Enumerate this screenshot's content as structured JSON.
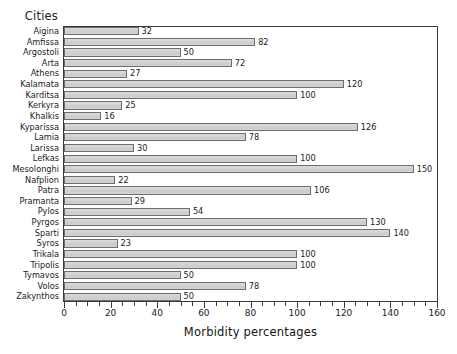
{
  "chart_data": {
    "type": "bar",
    "orientation": "horizontal",
    "title": "",
    "xlabel": "Morbidity percentages",
    "ylabel": "Cities",
    "xlim": [
      0,
      160
    ],
    "major_tick_step": 20,
    "minor_tick_step": 5,
    "grid": false,
    "legend": false,
    "bar_fill_color": "#d2d2d2",
    "bar_border_color": "#6d6d6d",
    "value_labels_shown": true,
    "categories": [
      "Aigina",
      "Amfissa",
      "Argostoli",
      "Arta",
      "Athens",
      "Kalamata",
      "Karditsa",
      "Kerkyra",
      "Khalkis",
      "Kyparissa",
      "Lamia",
      "Larissa",
      "Lefkas",
      "Mesolonghi",
      "Nafplion",
      "Patra",
      "Pramanta",
      "Pylos",
      "Pyrgos",
      "Sparti",
      "Syros",
      "Trikala",
      "Tripolis",
      "Tymavos",
      "Volos",
      "Zakynthos"
    ],
    "values": [
      32,
      82,
      50,
      72,
      27,
      120,
      100,
      25,
      16,
      126,
      78,
      30,
      100,
      150,
      22,
      106,
      29,
      54,
      130,
      140,
      23,
      100,
      100,
      50,
      78,
      50
    ],
    "x_tick_labels": [
      "0",
      "20",
      "40",
      "60",
      "80",
      "100",
      "120",
      "140",
      "160"
    ],
    "x_tick_values": [
      0,
      20,
      40,
      60,
      80,
      100,
      120,
      140,
      160
    ]
  }
}
